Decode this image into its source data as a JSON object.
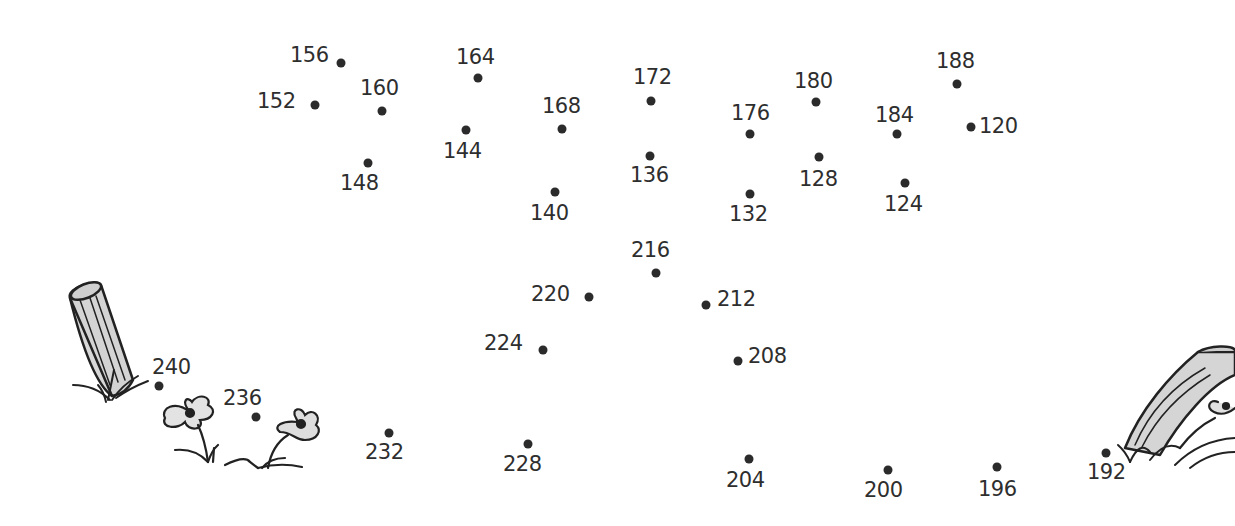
{
  "puzzle": {
    "type": "connect-the-dots",
    "ink_color": "#2b2b2b",
    "background": "#ffffff",
    "points": [
      {
        "n": "120",
        "x": 971,
        "y": 127,
        "lx": 979,
        "ly": 116
      },
      {
        "n": "124",
        "x": 905,
        "y": 183,
        "lx": 884,
        "ly": 194
      },
      {
        "n": "128",
        "x": 819,
        "y": 157,
        "lx": 799,
        "ly": 169
      },
      {
        "n": "132",
        "x": 750,
        "y": 194,
        "lx": 729,
        "ly": 204
      },
      {
        "n": "136",
        "x": 650,
        "y": 156,
        "lx": 630,
        "ly": 165
      },
      {
        "n": "140",
        "x": 555,
        "y": 192,
        "lx": 530,
        "ly": 203
      },
      {
        "n": "144",
        "x": 466,
        "y": 130,
        "lx": 443,
        "ly": 141
      },
      {
        "n": "148",
        "x": 368,
        "y": 163,
        "lx": 340,
        "ly": 173
      },
      {
        "n": "152",
        "x": 315,
        "y": 105,
        "lx": 257,
        "ly": 91
      },
      {
        "n": "156",
        "x": 341,
        "y": 63,
        "lx": 290,
        "ly": 45
      },
      {
        "n": "160",
        "x": 382,
        "y": 111,
        "lx": 360,
        "ly": 78
      },
      {
        "n": "164",
        "x": 478,
        "y": 78,
        "lx": 456,
        "ly": 47
      },
      {
        "n": "168",
        "x": 562,
        "y": 129,
        "lx": 542,
        "ly": 96
      },
      {
        "n": "172",
        "x": 651,
        "y": 101,
        "lx": 633,
        "ly": 67
      },
      {
        "n": "176",
        "x": 750,
        "y": 134,
        "lx": 731,
        "ly": 103
      },
      {
        "n": "180",
        "x": 816,
        "y": 102,
        "lx": 794,
        "ly": 71
      },
      {
        "n": "184",
        "x": 897,
        "y": 134,
        "lx": 875,
        "ly": 105
      },
      {
        "n": "188",
        "x": 957,
        "y": 84,
        "lx": 936,
        "ly": 51
      },
      {
        "n": "192",
        "x": 1106,
        "y": 453,
        "lx": 1087,
        "ly": 462
      },
      {
        "n": "196",
        "x": 997,
        "y": 467,
        "lx": 978,
        "ly": 479
      },
      {
        "n": "200",
        "x": 888,
        "y": 470,
        "lx": 864,
        "ly": 480
      },
      {
        "n": "204",
        "x": 749,
        "y": 459,
        "lx": 726,
        "ly": 470
      },
      {
        "n": "208",
        "x": 738,
        "y": 361,
        "lx": 748,
        "ly": 346
      },
      {
        "n": "212",
        "x": 706,
        "y": 305,
        "lx": 717,
        "ly": 289
      },
      {
        "n": "216",
        "x": 656,
        "y": 273,
        "lx": 631,
        "ly": 240
      },
      {
        "n": "220",
        "x": 589,
        "y": 297,
        "lx": 531,
        "ly": 284
      },
      {
        "n": "224",
        "x": 543,
        "y": 350,
        "lx": 484,
        "ly": 333
      },
      {
        "n": "228",
        "x": 528,
        "y": 444,
        "lx": 503,
        "ly": 454
      },
      {
        "n": "232",
        "x": 389,
        "y": 433,
        "lx": 365,
        "ly": 442
      },
      {
        "n": "236",
        "x": 256,
        "y": 417,
        "lx": 223,
        "ly": 388
      },
      {
        "n": "240",
        "x": 159,
        "y": 386,
        "lx": 152,
        "ly": 357
      }
    ],
    "decorations": [
      "left-log-stump",
      "left-grass-tuft",
      "left-flower-1",
      "left-flower-2",
      "right-log-stump",
      "right-flower",
      "right-grass"
    ]
  }
}
